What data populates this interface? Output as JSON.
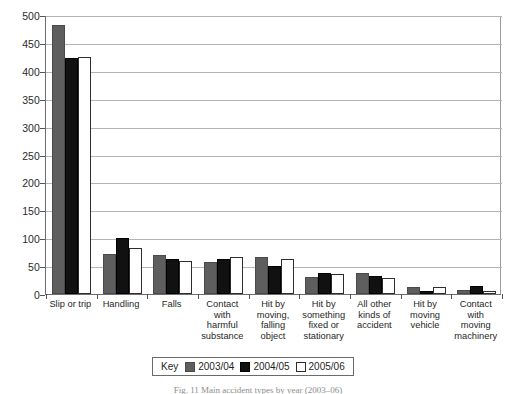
{
  "chart_data": {
    "type": "bar",
    "title": "",
    "xlabel": "",
    "ylabel": "",
    "ylim": [
      0,
      500
    ],
    "ytick_step": 50,
    "yticks": [
      500,
      450,
      400,
      350,
      300,
      250,
      200,
      150,
      100,
      50,
      0
    ],
    "grid": true,
    "legend_position": "bottom-center",
    "legend_title": "Key",
    "categories": [
      "Slip or trip",
      "Handling",
      "Falls",
      "Contact\nwith\nharmful\nsubstance",
      "Hit by\nmoving,\nfalling\nobject",
      "Hit by\nsomething\nfixed or\nstationary",
      "All other\nkinds of\naccident",
      "Hit by\nmoving\nvehicle",
      "Contact\nwith moving\nmachinery"
    ],
    "series": [
      {
        "name": "2003/04",
        "color": "#5e5e5e",
        "values": [
          483,
          72,
          70,
          58,
          66,
          31,
          37,
          13,
          8
        ]
      },
      {
        "name": "2004/05",
        "color": "#111111",
        "values": [
          423,
          101,
          62,
          62,
          51,
          38,
          32,
          6,
          14
        ]
      },
      {
        "name": "2005/06",
        "color": "#ffffff",
        "values": [
          425,
          83,
          59,
          66,
          62,
          36,
          29,
          12,
          5
        ]
      }
    ]
  },
  "caption": {
    "text": "Fig. 11  Main accident types by year (2003–06)"
  }
}
